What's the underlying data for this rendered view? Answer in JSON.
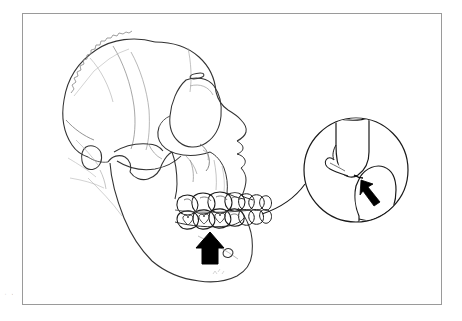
{
  "figure": {
    "domain": "anatomical-line-illustration",
    "background_color": "#ffffff",
    "frame": {
      "border_color": "#9a9a9a",
      "border_width_px": 1,
      "x": 22,
      "y": 13,
      "width": 420,
      "height": 292
    },
    "line_color": "#1a1a1a",
    "faint_line_color": "#6f6f6f",
    "fill_color": "#000000",
    "edge_caption_text": "  -\n  r\n  n\n  s\n  -\n  e"
  },
  "skull": {
    "label": "lateral-skull-outline",
    "parts": [
      {
        "name": "cranial-vault",
        "description": "rounded braincase, upper left"
      },
      {
        "name": "coronal-suture",
        "description": "serrated zigzag suture line across upper left cranium"
      },
      {
        "name": "temporal-lines",
        "description": "faint curved lines on the parietal region"
      },
      {
        "name": "frontal-bone",
        "description": "forehead contour"
      },
      {
        "name": "orbit",
        "description": "eye socket with supraorbital rim"
      },
      {
        "name": "supraorbital-foramen",
        "description": "small oval notch on superior orbital rim"
      },
      {
        "name": "nasal-bone",
        "description": "bridge of nose profile"
      },
      {
        "name": "nasal-aperture",
        "description": "pear-shaped piriform opening"
      },
      {
        "name": "anterior-nasal-spine",
        "description": "small projection below nasal aperture"
      },
      {
        "name": "zygomatic-arch",
        "description": "cheek bone bridge"
      },
      {
        "name": "mastoid-process",
        "description": "small rounded process behind ear region"
      },
      {
        "name": "external-acoustic-meatus",
        "description": "ear canal opening"
      },
      {
        "name": "mandibular-condyle",
        "description": "jaw joint head"
      },
      {
        "name": "coronoid-process",
        "description": "anterior ramus projection"
      },
      {
        "name": "mandibular-ramus",
        "description": "vertical jaw branch"
      },
      {
        "name": "mandibular-body",
        "description": "horizontal jaw body"
      },
      {
        "name": "mental-foramen",
        "description": "small oval opening on mandibular body"
      },
      {
        "name": "gonial-angle",
        "description": "angle of the mandible"
      },
      {
        "name": "maxilla",
        "description": "upper jaw bone"
      }
    ]
  },
  "dentition": {
    "label": "posterior-tooth-rows",
    "upper_row_tooth_count": 7,
    "lower_row_tooth_count": 7,
    "description": "upper and lower posterior teeth in occlusion, molars and premolars outlined with cusp detail"
  },
  "annotations": {
    "main_arrow": {
      "name": "mandible-arrow",
      "style": "solid-black-block-arrow",
      "direction": "up",
      "points_at": "mandibular body below the lower molars",
      "color": "#000000"
    },
    "inset_arrow": {
      "name": "occlusal-contact-arrow",
      "style": "solid-black-thin-arrow",
      "direction": "up-left",
      "points_at": "contact point between upper and lower tooth",
      "color": "#000000"
    },
    "leader_line": {
      "name": "magnification-leader",
      "description": "curved line from molar region to magnifier circle"
    }
  },
  "inset": {
    "label": "magnified-occlusion-detail",
    "shape": "circle",
    "center_x": 356,
    "center_y": 170,
    "radius": 52,
    "contents": [
      {
        "name": "upper-tooth-crown",
        "description": "tooth crown descending from top of circle"
      },
      {
        "name": "lower-tooth-crown",
        "description": "tooth crown ascending from bottom right"
      },
      {
        "name": "occlusal-contact-point",
        "description": "point where upper and lower crowns meet"
      },
      {
        "name": "adjacent-tooth-edge",
        "description": "neighboring tooth outline at left"
      }
    ]
  }
}
